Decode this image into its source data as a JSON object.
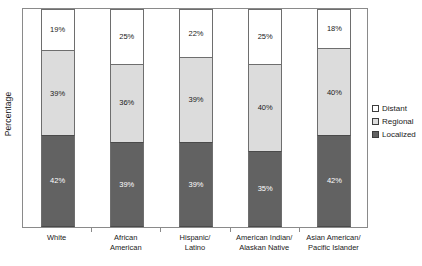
{
  "chart_data": {
    "type": "bar",
    "title": "",
    "subtitle": "",
    "xlabel": "",
    "ylabel": "Percentage",
    "ylim": [
      0,
      100
    ],
    "grid": false,
    "stacked": true,
    "stack_mode": "percent",
    "legend_position": "right",
    "categories": [
      "White",
      "African\nAmerican",
      "Hispanic/\nLatino",
      "American Indian/\nAlaskan Native",
      "Asian American/\nPacific Islander"
    ],
    "series": [
      {
        "name": "Distant",
        "color": "#ffffff",
        "values": [
          19,
          25,
          22,
          25,
          18
        ],
        "labels": [
          "19%",
          "25%",
          "22%",
          "25%",
          "18%"
        ]
      },
      {
        "name": "Regional",
        "color": "#dcdcdc",
        "values": [
          39,
          36,
          39,
          40,
          40
        ],
        "labels": [
          "39%",
          "36%",
          "39%",
          "40%",
          "40%"
        ]
      },
      {
        "name": "Localized",
        "color": "#626262",
        "values": [
          42,
          39,
          39,
          35,
          42
        ],
        "labels": [
          "42%",
          "39%",
          "39%",
          "35%",
          "42%"
        ]
      }
    ]
  },
  "legend": {
    "items": [
      {
        "label": "Distant"
      },
      {
        "label": "Regional"
      },
      {
        "label": "Localized"
      }
    ]
  },
  "colors": {
    "distant": "#ffffff",
    "regional": "#dcdcdc",
    "localized": "#626262",
    "axis": "#8a8a8a",
    "text": "#1a1a1a"
  }
}
